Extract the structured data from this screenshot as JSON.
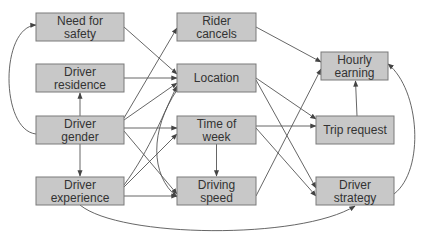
{
  "colors": {
    "node_fill": "#c8c8c8",
    "node_border": "#7a7a7a",
    "edge": "#555555",
    "text": "#333333",
    "background": "#ffffff"
  },
  "nodes": [
    {
      "id": "need_for_safety",
      "lines": [
        "Need for",
        "safety"
      ]
    },
    {
      "id": "driver_residence",
      "lines": [
        "Driver",
        "residence"
      ]
    },
    {
      "id": "driver_gender",
      "lines": [
        "Driver",
        "gender"
      ]
    },
    {
      "id": "driver_experience",
      "lines": [
        "Driver",
        "experience"
      ]
    },
    {
      "id": "rider_cancels",
      "lines": [
        "Rider",
        "cancels"
      ]
    },
    {
      "id": "location",
      "lines": [
        "Location"
      ]
    },
    {
      "id": "time_of_week",
      "lines": [
        "Time of",
        "week"
      ]
    },
    {
      "id": "driving_speed",
      "lines": [
        "Driving",
        "speed"
      ]
    },
    {
      "id": "hourly_earning",
      "lines": [
        "Hourly",
        "earning"
      ]
    },
    {
      "id": "trip_request",
      "lines": [
        "Trip request"
      ]
    },
    {
      "id": "driver_strategy",
      "lines": [
        "Driver",
        "strategy"
      ]
    }
  ],
  "edges": [
    {
      "from": "driver_gender",
      "to": "need_for_safety"
    },
    {
      "from": "driver_gender",
      "to": "driver_residence"
    },
    {
      "from": "driver_gender",
      "to": "driver_experience"
    },
    {
      "from": "driver_gender",
      "to": "rider_cancels"
    },
    {
      "from": "driver_gender",
      "to": "location"
    },
    {
      "from": "driver_gender",
      "to": "time_of_week"
    },
    {
      "from": "driver_gender",
      "to": "driving_speed"
    },
    {
      "from": "need_for_safety",
      "to": "location"
    },
    {
      "from": "driver_residence",
      "to": "location"
    },
    {
      "from": "driver_experience",
      "to": "location"
    },
    {
      "from": "driver_experience",
      "to": "time_of_week"
    },
    {
      "from": "driver_experience",
      "to": "driving_speed"
    },
    {
      "from": "driver_experience",
      "to": "driver_strategy"
    },
    {
      "from": "location",
      "to": "driving_speed"
    },
    {
      "from": "time_of_week",
      "to": "driving_speed"
    },
    {
      "from": "rider_cancels",
      "to": "hourly_earning"
    },
    {
      "from": "location",
      "to": "trip_request"
    },
    {
      "from": "location",
      "to": "driver_strategy"
    },
    {
      "from": "time_of_week",
      "to": "trip_request"
    },
    {
      "from": "time_of_week",
      "to": "driver_strategy"
    },
    {
      "from": "driving_speed",
      "to": "hourly_earning"
    },
    {
      "from": "trip_request",
      "to": "hourly_earning"
    },
    {
      "from": "driver_strategy",
      "to": "hourly_earning"
    }
  ]
}
